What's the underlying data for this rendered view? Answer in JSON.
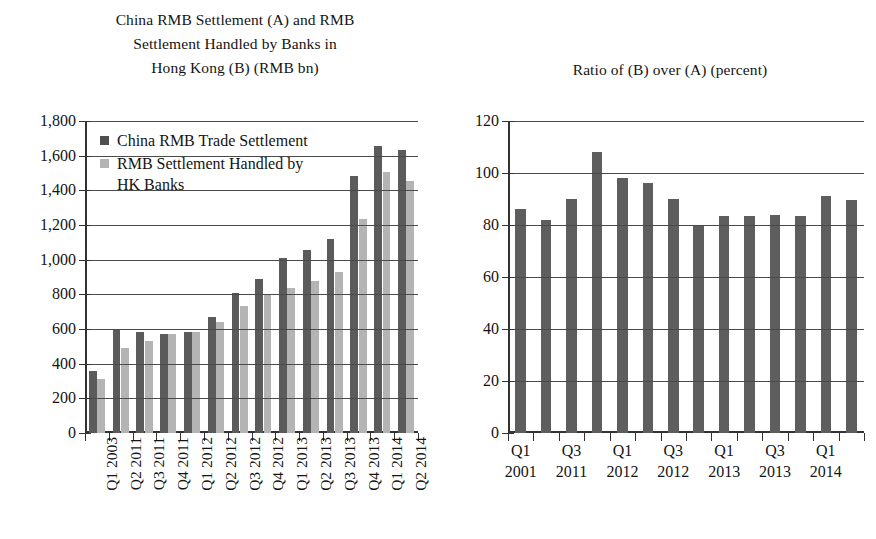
{
  "figure": {
    "left_title": "China RMB Settlement (A) and RMB Settlement Handled by Banks in Hong Kong (B) (RMB bn)",
    "left_title_line1": "China RMB Settlement (A) and RMB",
    "left_title_line2": "Settlement Handled by Banks in",
    "left_title_line3": "Hong Kong (B) (RMB bn)",
    "right_title": "Ratio of (B) over (A) (percent)",
    "colors": {
      "dark_series": "#5b5b5b",
      "light_series": "#b4b4b4",
      "axis": "#333333",
      "gridline": "#4a4a4a",
      "background": "#ffffff"
    }
  },
  "chart_data": [
    {
      "type": "bar",
      "title": "China RMB Settlement (A) and RMB Settlement Handled by Banks in Hong Kong (B) (RMB bn)",
      "xlabel": "",
      "ylabel": "RMB bn",
      "ylim": [
        0,
        1800
      ],
      "yticks": [
        0,
        200,
        400,
        600,
        800,
        1000,
        1200,
        1400,
        1600,
        1800
      ],
      "ytick_labels": [
        "0",
        "200",
        "400",
        "600",
        "800",
        "1,000",
        "1,200",
        "1,400",
        "1,600",
        "1,800"
      ],
      "grid": true,
      "legend_position": "upper-left-inside",
      "categories": [
        "Q1 2003",
        "Q2 2011",
        "Q3 2011",
        "Q4 2011",
        "Q1 2012",
        "Q2 2012",
        "Q3 2012",
        "Q4 2012",
        "Q1 2013",
        "Q2 2013",
        "Q3 2013",
        "Q4 2013",
        "Q1 2014",
        "Q2 2014"
      ],
      "series": [
        {
          "name": "China RMB Trade Settlement",
          "color": "#5b5b5b",
          "values": [
            360,
            600,
            583,
            570,
            583,
            670,
            805,
            890,
            1010,
            1055,
            1120,
            1480,
            1655,
            1630
          ]
        },
        {
          "name": "RMB Settlement Handled by HK Banks",
          "color": "#b4b4b4",
          "values": [
            310,
            490,
            530,
            570,
            583,
            640,
            735,
            800,
            835,
            875,
            930,
            1235,
            1505,
            1455
          ]
        }
      ]
    },
    {
      "type": "bar",
      "title": "Ratio of (B) over (A) (percent)",
      "xlabel": "",
      "ylabel": "percent",
      "ylim": [
        0,
        120
      ],
      "yticks": [
        0,
        20,
        40,
        60,
        80,
        100,
        120
      ],
      "ytick_labels": [
        "0",
        "20",
        "40",
        "60",
        "80",
        "100",
        "120"
      ],
      "grid": true,
      "legend_position": "none",
      "categories": [
        "Q1 2001",
        "Q2 2011",
        "Q3 2011",
        "Q4 2011",
        "Q1 2012",
        "Q2 2012",
        "Q3 2012",
        "Q4 2012",
        "Q1 2013",
        "Q2 2013",
        "Q3 2013",
        "Q4 2013",
        "Q1 2014",
        "Q2 2014"
      ],
      "xtick_labels": [
        {
          "line1": "Q1",
          "line2": "2001"
        },
        {
          "line1": "Q3",
          "line2": "2011"
        },
        {
          "line1": "Q1",
          "line2": "2012"
        },
        {
          "line1": "Q3",
          "line2": "2012"
        },
        {
          "line1": "Q1",
          "line2": "2013"
        },
        {
          "line1": "Q3",
          "line2": "2013"
        },
        {
          "line1": "Q1",
          "line2": "2014"
        }
      ],
      "series": [
        {
          "name": "Ratio of (B) over (A)",
          "color": "#5e5e5e",
          "values": [
            86,
            82,
            90,
            108,
            98,
            96,
            90,
            80,
            83.5,
            83.5,
            84,
            83.5,
            91,
            89.5
          ]
        }
      ]
    }
  ]
}
